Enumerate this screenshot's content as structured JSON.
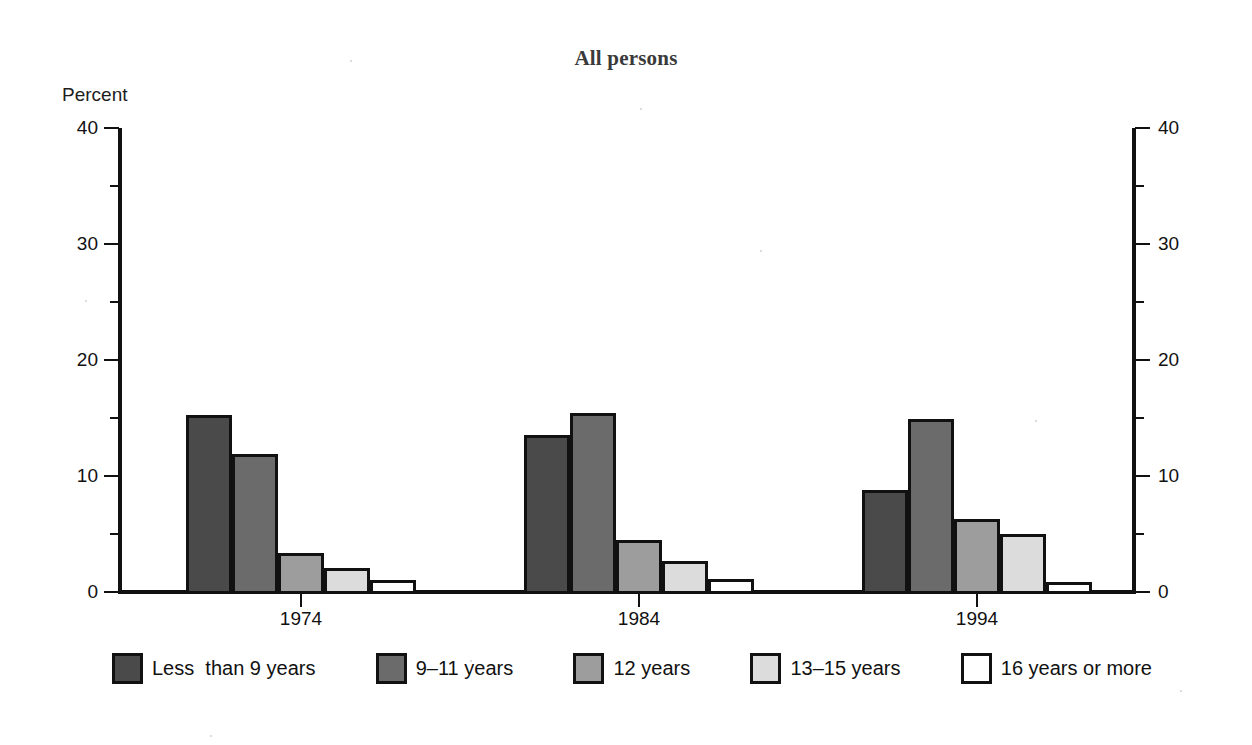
{
  "chart_data": {
    "type": "bar",
    "title": "All persons",
    "xlabel": "",
    "ylabel": "Percent",
    "ylim": [
      0,
      40
    ],
    "ytick_labels": [
      "0",
      "10",
      "20",
      "30",
      "40"
    ],
    "ytick_values": [
      0,
      10,
      20,
      30,
      40
    ],
    "yminor_values": [
      5,
      15,
      25,
      35
    ],
    "grid": false,
    "dual_y_axis": true,
    "legend_position": "bottom",
    "categories": [
      "1974",
      "1984",
      "1994"
    ],
    "series": [
      {
        "name": "Less  than 9 years",
        "color": "#4a4a4a",
        "values": [
          15.3,
          13.5,
          8.8
        ]
      },
      {
        "name": "9–11 years",
        "color": "#6b6b6b",
        "values": [
          11.9,
          15.4,
          14.9
        ]
      },
      {
        "name": "12 years",
        "color": "#9d9d9d",
        "values": [
          3.4,
          4.5,
          6.3
        ]
      },
      {
        "name": "13–15 years",
        "color": "#dcdcdc",
        "values": [
          2.1,
          2.7,
          5.0
        ]
      },
      {
        "name": "16 years or more",
        "color": "#ffffff",
        "values": [
          1.0,
          1.1,
          0.9
        ]
      }
    ]
  },
  "axis": {
    "left_title": "Percent",
    "labels": [
      "0",
      "10",
      "20",
      "30",
      "40"
    ]
  },
  "legend": {
    "items": [
      {
        "label": "Less  than 9 years",
        "color": "#4a4a4a"
      },
      {
        "label": "9–11 years",
        "color": "#6b6b6b"
      },
      {
        "label": "12 years",
        "color": "#9d9d9d"
      },
      {
        "label": "13–15 years",
        "color": "#dcdcdc"
      },
      {
        "label": "16 years or more",
        "color": "#ffffff"
      }
    ]
  }
}
